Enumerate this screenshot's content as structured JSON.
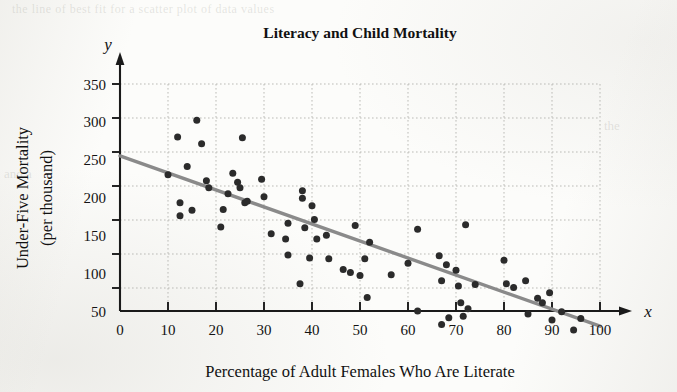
{
  "figure": {
    "title": "Literacy and Child Mortality",
    "x_axis_letter": "x",
    "y_axis_letter": "y",
    "background_color": "#fcfcfa",
    "point_color": "#2b2b2b",
    "line_color": "#8a8a8a",
    "grid_color": "#b9b9b4"
  },
  "chart_data": {
    "type": "scatter",
    "title": "Literacy and Child Mortality",
    "xlabel": "Percentage of Adult Females Who Are Literate",
    "ylabel": "Under-Five Mortality (per thousand)",
    "ylabel_line1": "Under-Five Mortality",
    "ylabel_line2": "(per thousand)",
    "xlim": [
      0,
      103
    ],
    "ylim": [
      0,
      370
    ],
    "xticks": [
      0,
      10,
      20,
      30,
      40,
      50,
      60,
      70,
      80,
      90,
      100
    ],
    "xtick_labels": [
      "0",
      "10",
      "20",
      "30",
      "40",
      "50",
      "60",
      "70",
      "80",
      "90",
      "100"
    ],
    "yticks": [
      50,
      100,
      150,
      200,
      250,
      300,
      350
    ],
    "ytick_labels": [
      "50",
      "100",
      "150",
      "200",
      "250",
      "300",
      "350"
    ],
    "grid": true,
    "grid_style": "dotted",
    "legend": null,
    "axis_style": "arrow-tipped axes with x and y letters",
    "series": [
      {
        "name": "Countries",
        "marker": "filled-circle",
        "marker_size": 7,
        "color": "#2b2b2b",
        "points": [
          [
            10,
            230
          ],
          [
            12,
            280
          ],
          [
            12.5,
            193
          ],
          [
            12.5,
            176
          ],
          [
            14,
            241
          ],
          [
            15,
            183
          ],
          [
            16,
            302
          ],
          [
            17,
            271
          ],
          [
            18,
            222
          ],
          [
            18.5,
            213
          ],
          [
            21,
            161
          ],
          [
            21.5,
            184
          ],
          [
            22.5,
            205
          ],
          [
            23.5,
            232
          ],
          [
            24.5,
            220
          ],
          [
            25,
            213
          ],
          [
            25.5,
            279
          ],
          [
            26,
            193
          ],
          [
            26.5,
            195
          ],
          [
            29.5,
            224
          ],
          [
            30,
            201
          ],
          [
            31.5,
            152
          ],
          [
            34.5,
            145
          ],
          [
            35,
            166
          ],
          [
            35,
            124
          ],
          [
            37.5,
            86
          ],
          [
            38,
            209
          ],
          [
            38,
            199
          ],
          [
            38.5,
            160
          ],
          [
            39.5,
            120
          ],
          [
            40,
            189
          ],
          [
            40.5,
            171
          ],
          [
            41,
            145
          ],
          [
            43,
            150
          ],
          [
            43.5,
            119
          ],
          [
            46.5,
            105
          ],
          [
            48,
            101
          ],
          [
            49,
            163
          ],
          [
            50,
            97
          ],
          [
            51,
            119
          ],
          [
            51.5,
            68
          ],
          [
            52,
            141
          ],
          [
            56.5,
            98
          ],
          [
            60,
            113
          ],
          [
            62,
            158
          ],
          [
            62,
            50
          ],
          [
            66.5,
            123
          ],
          [
            67,
            90
          ],
          [
            67,
            32
          ],
          [
            68,
            111
          ],
          [
            68.5,
            41
          ],
          [
            70,
            104
          ],
          [
            70.5,
            83
          ],
          [
            71,
            61
          ],
          [
            71.5,
            43
          ],
          [
            72,
            164
          ],
          [
            72.5,
            53
          ],
          [
            74,
            85
          ],
          [
            80,
            117
          ],
          [
            80.5,
            86
          ],
          [
            82,
            81
          ],
          [
            84.5,
            90
          ],
          [
            85,
            46
          ],
          [
            87,
            67
          ],
          [
            88,
            61
          ],
          [
            89.5,
            74
          ],
          [
            90,
            38
          ],
          [
            92,
            49
          ],
          [
            94.5,
            25
          ],
          [
            96,
            40
          ]
        ]
      }
    ],
    "trend_line": {
      "name": "Least-squares regression line",
      "color": "#8a8a8a",
      "x_start": 0,
      "y_start": 255,
      "x_end": 100,
      "y_end": 30
    }
  }
}
